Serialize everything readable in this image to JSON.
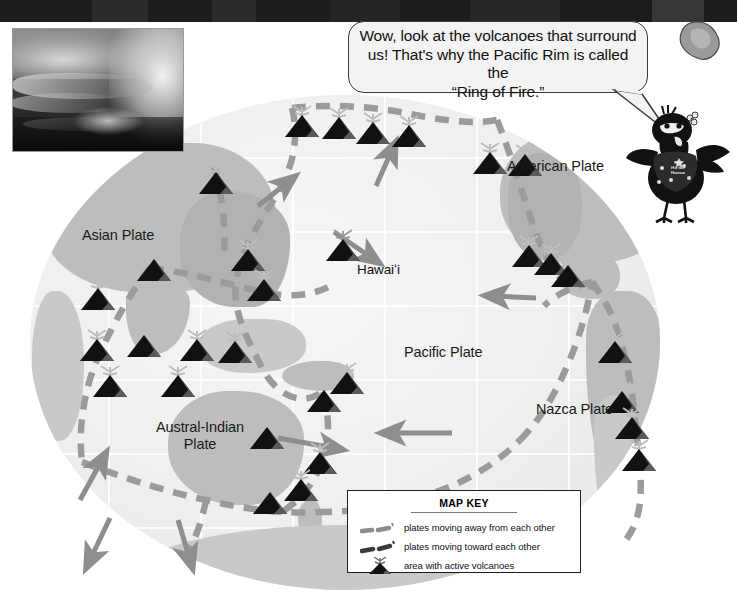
{
  "page": {
    "width": 737,
    "height": 601
  },
  "speech_bubble": {
    "speaker": "bird-character",
    "line1": "Wow, look at the volcanoes that surround",
    "line2": "us!  That's why the Pacific Rim is called the",
    "line3": "“Ring of Fire.”"
  },
  "bird": {
    "name": "alala-bird-character",
    "shirt_line1": "Hui",
    "shirt_line2": "Hōʻike",
    "shirt_line3": "Honua"
  },
  "photo": {
    "name": "volcano-eruption-photo",
    "caption": ""
  },
  "island_inset": {
    "name": "hawaii-island-silhouette"
  },
  "map": {
    "plate_labels": [
      {
        "id": "asian-plate",
        "text": "Asian Plate",
        "x": 82,
        "y": 227,
        "multiline": false
      },
      {
        "id": "american-plate",
        "text": "American Plate",
        "x": 507,
        "y": 158,
        "multiline": false
      },
      {
        "id": "pacific-plate",
        "text": "Pacific Plate",
        "x": 404,
        "y": 344,
        "multiline": false
      },
      {
        "id": "nazca-plate",
        "text": "Nazca Plate",
        "x": 536,
        "y": 401,
        "multiline": false
      },
      {
        "id": "austral-indian-plate",
        "text": "Austral-Indian Plate",
        "x": 152,
        "y": 419,
        "multiline": true
      }
    ],
    "place_labels": [
      {
        "id": "hawaii",
        "text": "Hawaiʻi",
        "x": 357,
        "y": 262
      }
    ],
    "volcano_marker_count": 31,
    "volcano_markers": [
      [
        300,
        118
      ],
      [
        337,
        120
      ],
      [
        371,
        125
      ],
      [
        407,
        128
      ],
      [
        214,
        175
      ],
      [
        488,
        155
      ],
      [
        523,
        157
      ],
      [
        152,
        262
      ],
      [
        246,
        252
      ],
      [
        527,
        248
      ],
      [
        549,
        256
      ],
      [
        96,
        291
      ],
      [
        262,
        282
      ],
      [
        566,
        268
      ],
      [
        95,
        342
      ],
      [
        142,
        338
      ],
      [
        195,
        342
      ],
      [
        233,
        344
      ],
      [
        345,
        375
      ],
      [
        613,
        344
      ],
      [
        322,
        393
      ],
      [
        620,
        394
      ],
      [
        630,
        420
      ],
      [
        637,
        452
      ],
      [
        265,
        430
      ],
      [
        299,
        482
      ],
      [
        318,
        455
      ],
      [
        341,
        262
      ],
      [
        108,
        378
      ],
      [
        176,
        378
      ],
      [
        268,
        495
      ]
    ],
    "colors": {
      "ocean": "#f1f1f1",
      "land": "#bdbdbd",
      "boundary_dash": "#9b9b9b",
      "arrow": "#8e8e8e",
      "volcano": "#111111",
      "label_text": "#1a1a1a",
      "top_band": "#1c1c1c",
      "bubble_fill": "#f3f3f3",
      "bubble_stroke": "#3a3a3a",
      "key_border": "#1d1d1d"
    }
  },
  "map_key": {
    "title": "MAP KEY",
    "rows": [
      {
        "id": "key-diverging",
        "symbol": "dashed-line-diverging",
        "label": "plates moving away from each other"
      },
      {
        "id": "key-converging",
        "symbol": "dashed-line-converging",
        "label": "plates moving toward each other"
      },
      {
        "id": "key-volcanoes",
        "symbol": "volcano-icon",
        "label": "area with active volcanoes"
      }
    ]
  }
}
